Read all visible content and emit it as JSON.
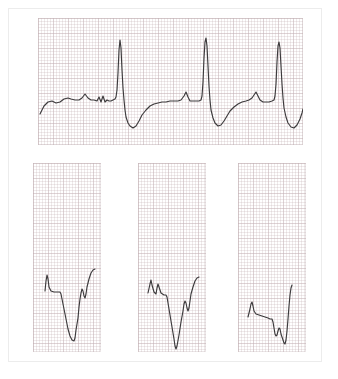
{
  "document": {
    "type": "ecg-recording",
    "title": "Electrocardiogram Recording",
    "paper": {
      "background_color": "#ffffff",
      "grid_minor_color": "#b8a0a6",
      "grid_major_color": "#c4b0b4",
      "border_color": "#ececec"
    },
    "trace": {
      "color": "#3c3a3c",
      "width_px": 1.15
    }
  },
  "panels": [
    {
      "id": "rhythm-strip",
      "label": "Rhythm strip",
      "position": "top",
      "x": 38,
      "y": 18,
      "width": 265,
      "height": 127,
      "grid_minor_px": 3,
      "grid_major_px": 15,
      "beats": 3,
      "description": "Long lead rhythm strip with three QRS complexes, tall R waves, deep S waves and recovering T waves"
    },
    {
      "id": "lead-strip-1",
      "label": "Lead strip 1",
      "position": "bottom-left",
      "x": 33,
      "y": 163,
      "width": 68,
      "height": 189,
      "grid_minor_px": 3,
      "grid_major_px": 15,
      "beats": 1,
      "description": "Single complex with deep negative QS deflection followed by upward recovery"
    },
    {
      "id": "lead-strip-2",
      "label": "Lead strip 2",
      "position": "bottom-center",
      "x": 138,
      "y": 163,
      "width": 68,
      "height": 189,
      "grid_minor_px": 3,
      "grid_major_px": 15,
      "beats": 1,
      "description": "Single complex with deep V-shaped negative deflection and notched positive rebound"
    },
    {
      "id": "lead-strip-3",
      "label": "Lead strip 3",
      "position": "bottom-right",
      "x": 238,
      "y": 163,
      "width": 68,
      "height": 189,
      "grid_minor_px": 3,
      "grid_major_px": 15,
      "beats": 1,
      "description": "Single complex with small negative dip and tall sharp upstroke"
    }
  ],
  "chart_data": {
    "type": "line",
    "xlabel": "",
    "ylabel": "",
    "grid": true,
    "legend": false,
    "series": [
      {
        "name": "rhythm-strip",
        "panel": "rhythm-strip",
        "xlim": [
          0,
          265
        ],
        "ylim": [
          0,
          127
        ],
        "points": [
          [
            2,
            96
          ],
          [
            6,
            88
          ],
          [
            10,
            84
          ],
          [
            14,
            83
          ],
          [
            18,
            85
          ],
          [
            22,
            84
          ],
          [
            26,
            81
          ],
          [
            30,
            80
          ],
          [
            33,
            81
          ],
          [
            37,
            82
          ],
          [
            41,
            82
          ],
          [
            44,
            80
          ],
          [
            47,
            76
          ],
          [
            50,
            80
          ],
          [
            53,
            82
          ],
          [
            56,
            82
          ],
          [
            59,
            83
          ],
          [
            61,
            79
          ],
          [
            63,
            84
          ],
          [
            65,
            78
          ],
          [
            67,
            84
          ],
          [
            69,
            82
          ],
          [
            71,
            83
          ],
          [
            73,
            83
          ],
          [
            75,
            82
          ],
          [
            77,
            81
          ],
          [
            78,
            79
          ],
          [
            79,
            72
          ],
          [
            80,
            55
          ],
          [
            81,
            32
          ],
          [
            82,
            22
          ],
          [
            83,
            30
          ],
          [
            84,
            52
          ],
          [
            85,
            70
          ],
          [
            86,
            82
          ],
          [
            87,
            92
          ],
          [
            88,
            99
          ],
          [
            90,
            105
          ],
          [
            92,
            108
          ],
          [
            95,
            110
          ],
          [
            98,
            108
          ],
          [
            101,
            103
          ],
          [
            104,
            97
          ],
          [
            108,
            92
          ],
          [
            112,
            88
          ],
          [
            116,
            86
          ],
          [
            120,
            85
          ],
          [
            124,
            84
          ],
          [
            128,
            84
          ],
          [
            132,
            83
          ],
          [
            136,
            83
          ],
          [
            140,
            83
          ],
          [
            143,
            82
          ],
          [
            146,
            78
          ],
          [
            148,
            74
          ],
          [
            150,
            79
          ],
          [
            152,
            83
          ],
          [
            155,
            83
          ],
          [
            158,
            83
          ],
          [
            161,
            83
          ],
          [
            163,
            82
          ],
          [
            164,
            78
          ],
          [
            165,
            64
          ],
          [
            166,
            40
          ],
          [
            167,
            24
          ],
          [
            168,
            20
          ],
          [
            169,
            28
          ],
          [
            170,
            48
          ],
          [
            171,
            68
          ],
          [
            172,
            82
          ],
          [
            173,
            92
          ],
          [
            175,
            100
          ],
          [
            177,
            105
          ],
          [
            180,
            108
          ],
          [
            183,
            107
          ],
          [
            186,
            103
          ],
          [
            189,
            98
          ],
          [
            192,
            93
          ],
          [
            196,
            89
          ],
          [
            200,
            86
          ],
          [
            204,
            84
          ],
          [
            208,
            83
          ],
          [
            211,
            82
          ],
          [
            214,
            80
          ],
          [
            216,
            77
          ],
          [
            218,
            74
          ],
          [
            220,
            78
          ],
          [
            222,
            82
          ],
          [
            225,
            84
          ],
          [
            228,
            84
          ],
          [
            231,
            84
          ],
          [
            234,
            83
          ],
          [
            236,
            82
          ],
          [
            237,
            78
          ],
          [
            238,
            66
          ],
          [
            239,
            44
          ],
          [
            240,
            28
          ],
          [
            241,
            24
          ],
          [
            242,
            30
          ],
          [
            243,
            48
          ],
          [
            244,
            66
          ],
          [
            245,
            80
          ],
          [
            246,
            90
          ],
          [
            248,
            99
          ],
          [
            250,
            105
          ],
          [
            253,
            109
          ],
          [
            256,
            110
          ],
          [
            259,
            107
          ],
          [
            262,
            101
          ],
          [
            264,
            95
          ],
          [
            265,
            91
          ]
        ]
      },
      {
        "name": "lead-strip-1",
        "panel": "lead-strip-1",
        "xlim": [
          0,
          68
        ],
        "ylim": [
          0,
          189
        ],
        "points": [
          [
            12,
            128
          ],
          [
            13,
            118
          ],
          [
            14,
            112
          ],
          [
            15,
            116
          ],
          [
            16,
            124
          ],
          [
            18,
            128
          ],
          [
            21,
            129
          ],
          [
            24,
            129
          ],
          [
            27,
            129
          ],
          [
            28,
            131
          ],
          [
            29,
            136
          ],
          [
            31,
            146
          ],
          [
            33,
            156
          ],
          [
            35,
            166
          ],
          [
            37,
            173
          ],
          [
            39,
            177
          ],
          [
            41,
            178
          ],
          [
            42,
            175
          ],
          [
            43,
            167
          ],
          [
            45,
            155
          ],
          [
            46,
            144
          ],
          [
            47,
            136
          ],
          [
            48,
            130
          ],
          [
            49,
            126
          ],
          [
            50,
            128
          ],
          [
            51,
            133
          ],
          [
            52,
            135
          ],
          [
            53,
            131
          ],
          [
            54,
            124
          ],
          [
            56,
            116
          ],
          [
            58,
            110
          ],
          [
            60,
            107
          ],
          [
            62,
            106
          ]
        ]
      },
      {
        "name": "lead-strip-2",
        "panel": "lead-strip-2",
        "xlim": [
          0,
          68
        ],
        "ylim": [
          0,
          189
        ],
        "points": [
          [
            10,
            130
          ],
          [
            12,
            121
          ],
          [
            13,
            117
          ],
          [
            14,
            122
          ],
          [
            16,
            129
          ],
          [
            18,
            131
          ],
          [
            19,
            125
          ],
          [
            20,
            121
          ],
          [
            21,
            124
          ],
          [
            23,
            130
          ],
          [
            26,
            132
          ],
          [
            28,
            132
          ],
          [
            29,
            134
          ],
          [
            30,
            140
          ],
          [
            32,
            152
          ],
          [
            34,
            164
          ],
          [
            36,
            176
          ],
          [
            37,
            183
          ],
          [
            38,
            186
          ],
          [
            39,
            183
          ],
          [
            41,
            172
          ],
          [
            43,
            159
          ],
          [
            45,
            148
          ],
          [
            46,
            141
          ],
          [
            47,
            138
          ],
          [
            48,
            140
          ],
          [
            49,
            145
          ],
          [
            50,
            148
          ],
          [
            51,
            145
          ],
          [
            52,
            138
          ],
          [
            53,
            131
          ],
          [
            55,
            124
          ],
          [
            57,
            118
          ],
          [
            59,
            115
          ],
          [
            61,
            114
          ]
        ]
      },
      {
        "name": "lead-strip-3",
        "panel": "lead-strip-3",
        "xlim": [
          0,
          68
        ],
        "ylim": [
          0,
          189
        ],
        "points": [
          [
            10,
            154
          ],
          [
            12,
            146
          ],
          [
            13,
            141
          ],
          [
            14,
            139
          ],
          [
            15,
            143
          ],
          [
            16,
            148
          ],
          [
            18,
            151
          ],
          [
            21,
            152
          ],
          [
            24,
            153
          ],
          [
            27,
            154
          ],
          [
            30,
            155
          ],
          [
            32,
            156
          ],
          [
            34,
            156
          ],
          [
            35,
            159
          ],
          [
            36,
            165
          ],
          [
            37,
            171
          ],
          [
            38,
            173
          ],
          [
            39,
            172
          ],
          [
            40,
            168
          ],
          [
            41,
            165
          ],
          [
            42,
            166
          ],
          [
            43,
            171
          ],
          [
            45,
            177
          ],
          [
            46,
            180
          ],
          [
            47,
            181
          ],
          [
            48,
            177
          ],
          [
            49,
            168
          ],
          [
            50,
            156
          ],
          [
            51,
            143
          ],
          [
            52,
            132
          ],
          [
            53,
            125
          ],
          [
            54,
            122
          ]
        ]
      }
    ]
  }
}
